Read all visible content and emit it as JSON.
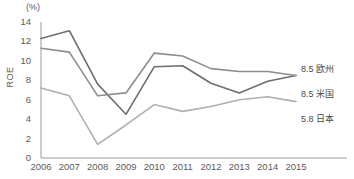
{
  "chart_data": {
    "type": "line",
    "title": "",
    "subtitle": "",
    "xlabel": "",
    "ylabel": "ROE",
    "unit_label": "(%)",
    "x": [
      2006,
      2007,
      2008,
      2009,
      2010,
      2011,
      2012,
      2013,
      2014,
      2015
    ],
    "categories": [
      "2006",
      "2007",
      "2008",
      "2009",
      "2010",
      "2011",
      "2012",
      "2013",
      "2014",
      "2015"
    ],
    "xlim": [
      2006,
      2015
    ],
    "ylim": [
      0,
      14
    ],
    "yticks": [
      0,
      2,
      4,
      6,
      8,
      10,
      12,
      14
    ],
    "ytick_labels": [
      "0",
      "2",
      "4",
      "6",
      "8",
      "10",
      "12",
      "14"
    ],
    "grid": false,
    "legend_position": "right-inline",
    "series": [
      {
        "name": "米国",
        "end_value_label": "8.5",
        "inline_label": "8.5 米国",
        "color": "#6e6e6e",
        "values": [
          12.3,
          13.1,
          7.6,
          4.5,
          9.4,
          9.5,
          7.7,
          6.7,
          7.9,
          8.5
        ]
      },
      {
        "name": "欧州",
        "end_value_label": "8.5",
        "inline_label": "8.5 欧州",
        "color": "#8d8d8d",
        "values": [
          11.3,
          10.9,
          6.4,
          6.7,
          10.8,
          10.5,
          9.2,
          8.9,
          8.9,
          8.5
        ]
      },
      {
        "name": "日本",
        "end_value_label": "5.8",
        "inline_label": "5.8 日本",
        "color": "#b0b0b0",
        "values": [
          7.2,
          6.4,
          1.4,
          3.4,
          5.5,
          4.8,
          5.3,
          6.0,
          6.3,
          5.8
        ]
      }
    ],
    "annotations": [
      {
        "text": "8.5 欧州",
        "series": "欧州"
      },
      {
        "text": "8.5 米国",
        "series": "米国"
      },
      {
        "text": "5.8 日本",
        "series": "日本"
      }
    ],
    "axis_color": "#9a9a9a"
  }
}
